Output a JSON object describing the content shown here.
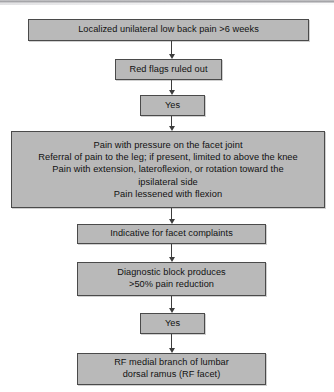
{
  "figure": {
    "type": "flowchart",
    "orientation": "vertical",
    "background_color": "#ffffff",
    "node_fill_color": "#b9b9b9",
    "node_border_color": "#4a4a4a",
    "connector_color": "#3d3d3d",
    "text_color": "#111111"
  },
  "nodes": [
    {
      "id": "node-1",
      "name": "complaint-box",
      "text": "Localized unilateral low back pain >6 weeks"
    },
    {
      "id": "node-2",
      "name": "red-flags-box",
      "text": "Red flags ruled out"
    },
    {
      "id": "node-3",
      "name": "yes-box-1",
      "text": "Yes"
    },
    {
      "id": "node-4",
      "name": "clinical-findings-box",
      "text": "Pain with pressure on the facet joint\nReferral of pain to the leg; if present, limited to above the knee\nPain with extension, lateroflexion, or rotation toward the\nipsilateral side\nPain lessened with flexion"
    },
    {
      "id": "node-5",
      "name": "indicative-box",
      "text": "Indicative for facet complaints"
    },
    {
      "id": "node-6",
      "name": "diagnostic-block-box",
      "text": "Diagnostic block produces\n>50% pain reduction"
    },
    {
      "id": "node-7",
      "name": "yes-box-2",
      "text": "Yes"
    },
    {
      "id": "node-8",
      "name": "treatment-box",
      "text": "RF medial branch of lumbar\ndorsal ramus (RF facet)"
    }
  ],
  "connectors": [
    {
      "id": "arrow-1",
      "from": "node-1",
      "to": "node-2"
    },
    {
      "id": "arrow-2",
      "from": "node-2",
      "to": "node-3"
    },
    {
      "id": "arrow-3",
      "from": "node-3",
      "to": "node-4"
    },
    {
      "id": "arrow-4",
      "from": "node-4",
      "to": "node-5"
    },
    {
      "id": "arrow-5",
      "from": "node-5",
      "to": "node-6"
    },
    {
      "id": "arrow-6",
      "from": "node-6",
      "to": "node-7"
    },
    {
      "id": "arrow-7",
      "from": "node-7",
      "to": "node-8"
    }
  ]
}
